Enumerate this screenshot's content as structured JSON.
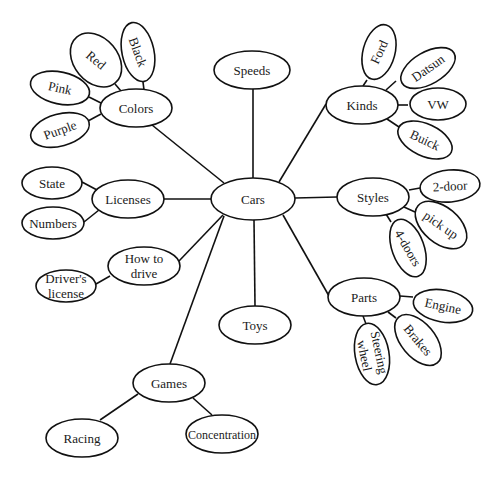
{
  "diagram": {
    "type": "concept-web",
    "nodes": [
      {
        "id": "cars",
        "label": [
          "Cars"
        ],
        "cx": 253,
        "cy": 199,
        "rx": 42,
        "ry": 21,
        "rot": 0
      },
      {
        "id": "speeds",
        "label": [
          "Speeds"
        ],
        "cx": 252,
        "cy": 70,
        "rx": 38,
        "ry": 19,
        "rot": 0
      },
      {
        "id": "toys",
        "label": [
          "Toys"
        ],
        "cx": 255,
        "cy": 325,
        "rx": 36,
        "ry": 19,
        "rot": 0
      },
      {
        "id": "colors",
        "label": [
          "Colors"
        ],
        "cx": 136,
        "cy": 108,
        "rx": 36,
        "ry": 19,
        "rot": 0
      },
      {
        "id": "black",
        "label": [
          "Black"
        ],
        "cx": 138,
        "cy": 52,
        "rx": 16,
        "ry": 30,
        "rot": -12,
        "textRot": 70
      },
      {
        "id": "red",
        "label": [
          "Red"
        ],
        "cx": 96,
        "cy": 60,
        "rx": 22,
        "ry": 30,
        "rot": -40,
        "textRot": 40
      },
      {
        "id": "pink",
        "label": [
          "Pink"
        ],
        "cx": 60,
        "cy": 88,
        "rx": 30,
        "ry": 16,
        "rot": 12,
        "textRot": 12
      },
      {
        "id": "purple",
        "label": [
          "Purple"
        ],
        "cx": 60,
        "cy": 130,
        "rx": 30,
        "ry": 16,
        "rot": -15,
        "textRot": -20
      },
      {
        "id": "kinds",
        "label": [
          "Kinds"
        ],
        "cx": 362,
        "cy": 105,
        "rx": 36,
        "ry": 19,
        "rot": 0
      },
      {
        "id": "ford",
        "label": [
          "Ford"
        ],
        "cx": 379,
        "cy": 52,
        "rx": 16,
        "ry": 28,
        "rot": 15,
        "textRot": -65
      },
      {
        "id": "datsun",
        "label": [
          "Datsun"
        ],
        "cx": 428,
        "cy": 68,
        "rx": 30,
        "ry": 16,
        "rot": -30,
        "textRot": -35
      },
      {
        "id": "vw",
        "label": [
          "VW"
        ],
        "cx": 438,
        "cy": 104,
        "rx": 28,
        "ry": 16,
        "rot": 0,
        "textRot": 0
      },
      {
        "id": "buick",
        "label": [
          "Buick"
        ],
        "cx": 425,
        "cy": 140,
        "rx": 29,
        "ry": 16,
        "rot": 25,
        "textRot": 25
      },
      {
        "id": "licenses",
        "label": [
          "Licenses"
        ],
        "cx": 128,
        "cy": 199,
        "rx": 36,
        "ry": 19,
        "rot": 0
      },
      {
        "id": "state",
        "label": [
          "State"
        ],
        "cx": 52,
        "cy": 183,
        "rx": 30,
        "ry": 16,
        "rot": 0
      },
      {
        "id": "numbers",
        "label": [
          "Numbers"
        ],
        "cx": 53,
        "cy": 223,
        "rx": 31,
        "ry": 16,
        "rot": 0
      },
      {
        "id": "how-to-drive",
        "label": [
          "How to",
          "drive"
        ],
        "cx": 144,
        "cy": 266,
        "rx": 36,
        "ry": 19,
        "rot": 0
      },
      {
        "id": "drivers-license",
        "label": [
          "Driver's",
          "license"
        ],
        "cx": 66,
        "cy": 286,
        "rx": 30,
        "ry": 16,
        "rot": 0
      },
      {
        "id": "styles",
        "label": [
          "Styles"
        ],
        "cx": 373,
        "cy": 197,
        "rx": 36,
        "ry": 19,
        "rot": 0
      },
      {
        "id": "two-door",
        "label": [
          "2-door"
        ],
        "cx": 450,
        "cy": 186,
        "rx": 30,
        "ry": 16,
        "rot": -5,
        "textRot": -3
      },
      {
        "id": "pick-up",
        "label": [
          "pick up"
        ],
        "cx": 441,
        "cy": 225,
        "rx": 18,
        "ry": 30,
        "rot": -50,
        "textRot": 35
      },
      {
        "id": "four-doors",
        "label": [
          "4-doors"
        ],
        "cx": 408,
        "cy": 248,
        "rx": 16,
        "ry": 30,
        "rot": -20,
        "textRot": 60
      },
      {
        "id": "parts",
        "label": [
          "Parts"
        ],
        "cx": 364,
        "cy": 297,
        "rx": 36,
        "ry": 19,
        "rot": 0
      },
      {
        "id": "engine",
        "label": [
          "Engine"
        ],
        "cx": 443,
        "cy": 306,
        "rx": 30,
        "ry": 16,
        "rot": 10,
        "textRot": 12
      },
      {
        "id": "brakes",
        "label": [
          "Brakes"
        ],
        "cx": 418,
        "cy": 340,
        "rx": 17,
        "ry": 30,
        "rot": -40,
        "textRot": 50
      },
      {
        "id": "steering-wheel",
        "label": [
          "Steering",
          "wheel"
        ],
        "cx": 372,
        "cy": 354,
        "rx": 17,
        "ry": 31,
        "rot": -10,
        "textRot": 78
      },
      {
        "id": "games",
        "label": [
          "Games"
        ],
        "cx": 169,
        "cy": 383,
        "rx": 36,
        "ry": 19,
        "rot": 0
      },
      {
        "id": "racing",
        "label": [
          "Racing"
        ],
        "cx": 82,
        "cy": 438,
        "rx": 36,
        "ry": 19,
        "rot": 0
      },
      {
        "id": "concentration",
        "label": [
          "Concentration"
        ],
        "cx": 222,
        "cy": 434,
        "rx": 36,
        "ry": 19,
        "rot": 0
      }
    ],
    "edges": [
      {
        "from": "cars",
        "to": "speeds",
        "x1": 253,
        "y1": 178,
        "x2": 253,
        "y2": 89
      },
      {
        "from": "cars",
        "to": "toys",
        "x1": 254,
        "y1": 220,
        "x2": 255,
        "y2": 306
      },
      {
        "from": "cars",
        "to": "colors",
        "x1": 224,
        "y1": 183,
        "x2": 152,
        "y2": 125
      },
      {
        "from": "cars",
        "to": "kinds",
        "x1": 279,
        "y1": 182,
        "x2": 326,
        "y2": 104
      },
      {
        "from": "cars",
        "to": "licenses",
        "x1": 211,
        "y1": 199,
        "x2": 164,
        "y2": 199
      },
      {
        "from": "cars",
        "to": "styles",
        "x1": 295,
        "y1": 198,
        "x2": 337,
        "y2": 197
      },
      {
        "from": "cars",
        "to": "how-to-drive",
        "x1": 223,
        "y1": 215,
        "x2": 179,
        "y2": 261
      },
      {
        "from": "cars",
        "to": "games",
        "x1": 224,
        "y1": 216,
        "x2": 170,
        "y2": 364
      },
      {
        "from": "cars",
        "to": "parts",
        "x1": 283,
        "y1": 215,
        "x2": 329,
        "y2": 296
      },
      {
        "from": "colors",
        "to": "black",
        "x1": 144,
        "y1": 90,
        "x2": 143,
        "y2": 82
      },
      {
        "from": "colors",
        "to": "red",
        "x1": 121,
        "y1": 91,
        "x2": 115,
        "y2": 84
      },
      {
        "from": "colors",
        "to": "pink",
        "x1": 101,
        "y1": 103,
        "x2": 89,
        "y2": 97
      },
      {
        "from": "colors",
        "to": "purple",
        "x1": 101,
        "y1": 114,
        "x2": 88,
        "y2": 121
      },
      {
        "from": "kinds",
        "to": "ford",
        "x1": 363,
        "y1": 86,
        "x2": 367,
        "y2": 80
      },
      {
        "from": "kinds",
        "to": "datsun",
        "x1": 386,
        "y1": 90,
        "x2": 396,
        "y2": 81
      },
      {
        "from": "kinds",
        "to": "vw",
        "x1": 398,
        "y1": 105,
        "x2": 408,
        "y2": 105
      },
      {
        "from": "kinds",
        "to": "buick",
        "x1": 387,
        "y1": 119,
        "x2": 399,
        "y2": 127
      },
      {
        "from": "licenses",
        "to": "state",
        "x1": 97,
        "y1": 190,
        "x2": 82,
        "y2": 182
      },
      {
        "from": "licenses",
        "to": "numbers",
        "x1": 99,
        "y1": 210,
        "x2": 84,
        "y2": 222
      },
      {
        "from": "how-to-drive",
        "to": "drivers-license",
        "x1": 110,
        "y1": 276,
        "x2": 96,
        "y2": 284
      },
      {
        "from": "styles",
        "to": "two-door",
        "x1": 409,
        "y1": 190,
        "x2": 420,
        "y2": 188
      },
      {
        "from": "styles",
        "to": "pick-up",
        "x1": 404,
        "y1": 207,
        "x2": 415,
        "y2": 212
      },
      {
        "from": "styles",
        "to": "four-doors",
        "x1": 386,
        "y1": 214,
        "x2": 391,
        "y2": 222
      },
      {
        "from": "parts",
        "to": "engine",
        "x1": 400,
        "y1": 296,
        "x2": 413,
        "y2": 297
      },
      {
        "from": "parts",
        "to": "brakes",
        "x1": 388,
        "y1": 312,
        "x2": 396,
        "y2": 318
      },
      {
        "from": "parts",
        "to": "steering-wheel",
        "x1": 363,
        "y1": 316,
        "x2": 366,
        "y2": 324
      },
      {
        "from": "games",
        "to": "racing",
        "x1": 138,
        "y1": 394,
        "x2": 100,
        "y2": 420
      },
      {
        "from": "games",
        "to": "concentration",
        "x1": 193,
        "y1": 398,
        "x2": 212,
        "y2": 415
      }
    ]
  }
}
